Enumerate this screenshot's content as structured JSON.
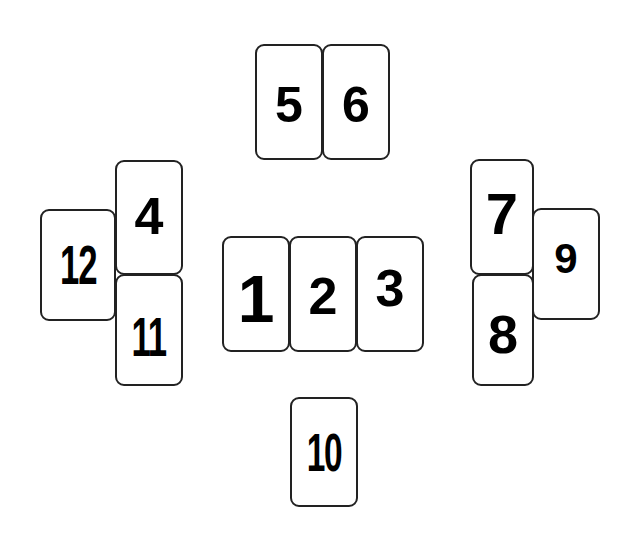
{
  "diagram": {
    "title": "",
    "cards": [
      {
        "id": "card-1",
        "label": "1"
      },
      {
        "id": "card-2",
        "label": "2"
      },
      {
        "id": "card-3",
        "label": "3"
      },
      {
        "id": "card-4",
        "label": "4"
      },
      {
        "id": "card-5",
        "label": "5"
      },
      {
        "id": "card-6",
        "label": "6"
      },
      {
        "id": "card-7",
        "label": "7"
      },
      {
        "id": "card-8",
        "label": "8"
      },
      {
        "id": "card-9",
        "label": "9"
      },
      {
        "id": "card-10",
        "label": "10"
      },
      {
        "id": "card-11",
        "label": "11"
      },
      {
        "id": "card-12",
        "label": "12"
      }
    ],
    "groups": {
      "top": [
        "5",
        "6"
      ],
      "center": [
        "1",
        "2",
        "3"
      ],
      "left": [
        "4",
        "11",
        "12"
      ],
      "right": [
        "7",
        "8",
        "9"
      ],
      "bottom": [
        "10"
      ]
    },
    "colors": {
      "card_border": "#222222",
      "card_fill": "#ffffff",
      "text": "#000000",
      "background": "#ffffff"
    }
  }
}
